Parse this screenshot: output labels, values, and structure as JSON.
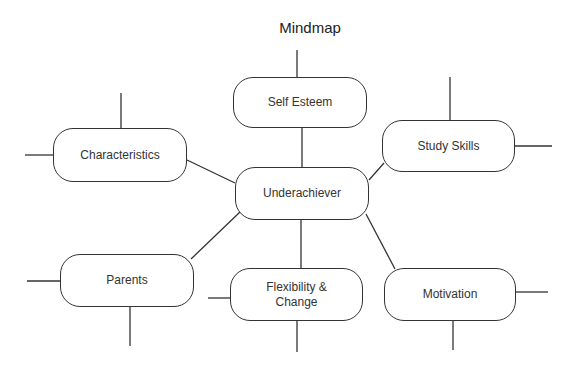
{
  "title": "Mindmap",
  "center": {
    "label": "Underachiever"
  },
  "nodes": [
    {
      "id": "self-esteem",
      "label": "Self Esteem"
    },
    {
      "id": "characteristics",
      "label": "Characteristics"
    },
    {
      "id": "study-skills",
      "label": "Study Skills"
    },
    {
      "id": "parents",
      "label": "Parents"
    },
    {
      "id": "flexibility-change",
      "label": "Flexibility & Change"
    },
    {
      "id": "motivation",
      "label": "Motivation"
    }
  ],
  "colors": {
    "stroke": "#333333",
    "background": "#ffffff"
  }
}
